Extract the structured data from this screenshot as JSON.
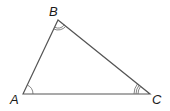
{
  "diagram": {
    "type": "triangle",
    "stroke_color": "#555555",
    "vertices": [
      {
        "label": "A",
        "x": 23,
        "y": 94,
        "angle_marks": 1
      },
      {
        "label": "B",
        "x": 58,
        "y": 20,
        "angle_marks": 2
      },
      {
        "label": "C",
        "x": 150,
        "y": 94,
        "angle_marks": 3
      }
    ],
    "labels": {
      "A": "A",
      "B": "B",
      "C": "C"
    }
  }
}
